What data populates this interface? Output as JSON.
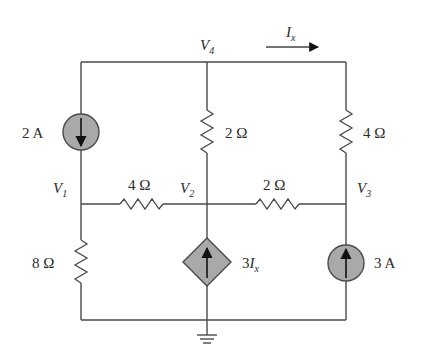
{
  "nodes": {
    "v1": {
      "name": "V",
      "sub": "1"
    },
    "v2": {
      "name": "V",
      "sub": "2"
    },
    "v3": {
      "name": "V",
      "sub": "3"
    },
    "v4": {
      "name": "V",
      "sub": "4"
    }
  },
  "components": {
    "current_source_left": {
      "label": "2 A",
      "direction": "down"
    },
    "current_source_right": {
      "label": "3 A",
      "direction": "up"
    },
    "dependent_source": {
      "coef": "3",
      "var": "I",
      "sub": "x",
      "direction": "up"
    },
    "r_v4_v2": {
      "label": "2 Ω"
    },
    "r_v4_v3": {
      "label": "4 Ω"
    },
    "r_v1_v2": {
      "label": "4 Ω"
    },
    "r_v2_v3": {
      "label": "2 Ω"
    },
    "r_v1_gnd": {
      "label": "8 Ω"
    }
  },
  "current_indicator": {
    "name": "I",
    "sub": "x",
    "direction": "right"
  },
  "colors": {
    "wire": "#4a4a4a",
    "source_fill": "#a9a9a9",
    "background": "#ffffff"
  }
}
